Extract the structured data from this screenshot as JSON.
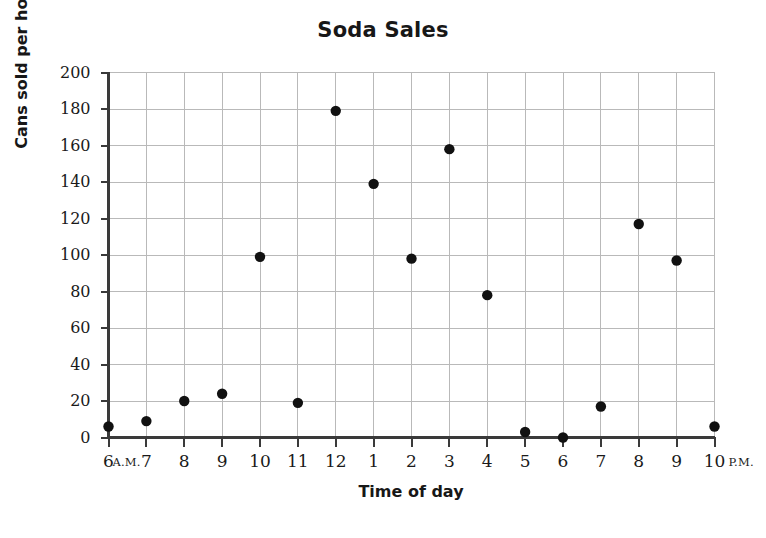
{
  "chart_data": {
    "type": "scatter",
    "title": "Soda Sales",
    "xlabel": "Time of day",
    "ylabel": "Cans sold per hour",
    "xlim": [
      6,
      22
    ],
    "ylim": [
      0,
      200
    ],
    "grid": true,
    "legend": false,
    "marker_color": "#111111",
    "grid_color": "#b9b9b9",
    "axis_color": "#3a3a3a",
    "x_tick_labels": [
      "6",
      "7",
      "8",
      "9",
      "10",
      "11",
      "12",
      "1",
      "2",
      "3",
      "4",
      "5",
      "6",
      "7",
      "8",
      "9",
      "10"
    ],
    "x_start_suffix": "A.M.",
    "x_end_suffix": "P.M.",
    "y_tick_labels": [
      "0",
      "20",
      "40",
      "60",
      "80",
      "100",
      "120",
      "140",
      "160",
      "180",
      "200"
    ],
    "y_ticks": [
      0,
      20,
      40,
      60,
      80,
      100,
      120,
      140,
      160,
      180,
      200
    ],
    "points": [
      {
        "label": "6 A.M.",
        "x": 6,
        "y": 6
      },
      {
        "label": "7 A.M.",
        "x": 7,
        "y": 9
      },
      {
        "label": "8 A.M.",
        "x": 8,
        "y": 20
      },
      {
        "label": "9 A.M.",
        "x": 9,
        "y": 24
      },
      {
        "label": "10 A.M.",
        "x": 10,
        "y": 99
      },
      {
        "label": "11 A.M.",
        "x": 11,
        "y": 19
      },
      {
        "label": "12 P.M.",
        "x": 12,
        "y": 179
      },
      {
        "label": "1 P.M.",
        "x": 13,
        "y": 139
      },
      {
        "label": "2 P.M.",
        "x": 14,
        "y": 98
      },
      {
        "label": "3 P.M.",
        "x": 15,
        "y": 158
      },
      {
        "label": "4 P.M.",
        "x": 16,
        "y": 78
      },
      {
        "label": "5 P.M.",
        "x": 17,
        "y": 3
      },
      {
        "label": "6 P.M.",
        "x": 18,
        "y": 0
      },
      {
        "label": "7 P.M.",
        "x": 19,
        "y": 17
      },
      {
        "label": "8 P.M.",
        "x": 20,
        "y": 117
      },
      {
        "label": "9 P.M.",
        "x": 21,
        "y": 97
      },
      {
        "label": "10 P.M.",
        "x": 22,
        "y": 6
      }
    ]
  }
}
